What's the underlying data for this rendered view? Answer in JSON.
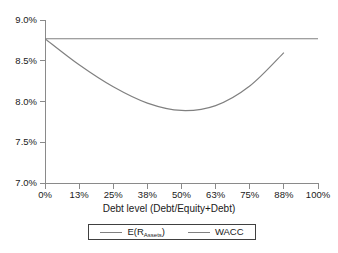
{
  "chart_data": {
    "type": "line",
    "title": "",
    "xlabel": "Debt level (Debt/Equity+Debt)",
    "ylabel": "",
    "xlim": [
      0,
      100
    ],
    "ylim": [
      7.0,
      9.0
    ],
    "grid": false,
    "legend_position": "below-axis",
    "x_tick_labels": [
      "0%",
      "13%",
      "25%",
      "38%",
      "50%",
      "63%",
      "75%",
      "88%",
      "100%"
    ],
    "x_tick_values": [
      0,
      12.5,
      25,
      37.5,
      50,
      62.5,
      75,
      87.5,
      100
    ],
    "y_tick_labels": [
      "9.0%",
      "8.5%",
      "8.0%",
      "7.5%",
      "7.0%"
    ],
    "y_tick_values": [
      9.0,
      8.5,
      8.0,
      7.5,
      7.0
    ],
    "series": [
      {
        "name": "E(RAssets)",
        "label_base": "E(R",
        "label_sub": "Assets",
        "label_tail": ")",
        "color": "#808080",
        "x": [
          0,
          12.5,
          25,
          37.5,
          50,
          62.5,
          75,
          87.5,
          100
        ],
        "values": [
          8.77,
          8.77,
          8.77,
          8.77,
          8.77,
          8.77,
          8.77,
          8.77,
          8.77
        ]
      },
      {
        "name": "WACC",
        "color": "#808080",
        "x": [
          0,
          12.5,
          25,
          37.5,
          50,
          62.5,
          75,
          87.5
        ],
        "values": [
          8.77,
          8.45,
          8.18,
          7.98,
          7.89,
          7.95,
          8.19,
          8.6
        ]
      }
    ]
  },
  "legend": {
    "entries": [
      {
        "label": "E(R",
        "sub": "Assets",
        "tail": ")"
      },
      {
        "label": "WACC",
        "sub": "",
        "tail": ""
      }
    ]
  },
  "axis": {
    "x_title": "Debt level (Debt/Equity+Debt)"
  }
}
